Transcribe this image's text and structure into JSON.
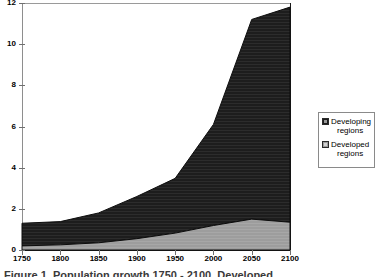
{
  "figure": {
    "caption": "Figure 1.  Population growth 1750 - 2100, Developed"
  },
  "legend": {
    "position": "right",
    "items": [
      {
        "name": "developing-regions",
        "line1": "Developing",
        "line2": "regions",
        "color": "#1d1d1d"
      },
      {
        "name": "developed-regions",
        "line1": "Developed",
        "line2": "regions",
        "color": "#9d9d9d"
      }
    ]
  },
  "chart_data": {
    "type": "area",
    "stacked": true,
    "title": "",
    "xlabel": "",
    "ylabel": "",
    "grid": false,
    "legend_position": "right",
    "xlim": [
      1750,
      2100
    ],
    "ylim": [
      0,
      12
    ],
    "xticks": [
      1750,
      1800,
      1850,
      1900,
      1950,
      2000,
      2050,
      2100
    ],
    "yticks": [
      0,
      2,
      4,
      6,
      8,
      10,
      12
    ],
    "x": [
      1750,
      1800,
      1850,
      1900,
      1950,
      2000,
      2050,
      2100
    ],
    "series": [
      {
        "name": "Developed regions",
        "color": "#9d9d9d",
        "values": [
          0.2,
          0.25,
          0.35,
          0.55,
          0.82,
          1.19,
          1.5,
          1.35
        ]
      },
      {
        "name": "Developing regions",
        "color": "#1d1d1d",
        "values": [
          1.1,
          1.13,
          1.45,
          2.05,
          2.66,
          4.91,
          9.7,
          10.45
        ]
      }
    ],
    "totals": [
      1.3,
      1.38,
      1.8,
      2.6,
      3.48,
      6.1,
      11.2,
      11.8
    ]
  }
}
